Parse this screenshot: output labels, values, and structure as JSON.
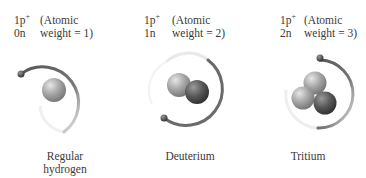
{
  "isotopes": [
    {
      "protons": "1p",
      "proton_sup": "+",
      "neutrons": "0n",
      "weight_line1": "(Atomic",
      "weight_line2": "weight = 1)",
      "name": "Regular hydrogen",
      "name_line1": "Regular",
      "name_line2": "hydrogen"
    },
    {
      "protons": "1p",
      "proton_sup": "+",
      "neutrons": "1n",
      "weight_line1": "(Atomic",
      "weight_line2": "weight = 2)",
      "name": "Deuterium",
      "name_line1": "Deuterium",
      "name_line2": ""
    },
    {
      "protons": "1p",
      "proton_sup": "+",
      "neutrons": "2n",
      "weight_line1": "(Atomic",
      "weight_line2": "weight = 3)",
      "name": "Tritium",
      "name_line1": "Tritium",
      "name_line2": ""
    }
  ],
  "colors": {
    "proton": "#a8a8a8",
    "neutron": "#5c5c5c",
    "orbit": "#6a6a6a",
    "electron": "#4a4a4a"
  }
}
